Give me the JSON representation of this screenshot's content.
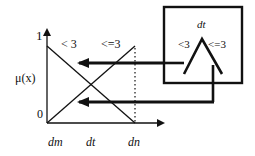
{
  "diagram": {
    "axis": {
      "y_label": "μ(x)",
      "y_tick_top": "1",
      "y_tick_bottom": "0",
      "x_ticks": [
        "dm",
        "dt",
        "dn"
      ]
    },
    "curves": {
      "descending_label": "< 3",
      "ascending_label": "<=3"
    },
    "node": {
      "title": "dt",
      "left_label": "<3",
      "right_label": "<=3"
    },
    "colors": {
      "stroke": "#111111",
      "background": "#ffffff"
    }
  }
}
